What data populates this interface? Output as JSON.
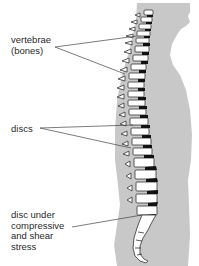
{
  "diagram": {
    "labels": {
      "vertebrae": "vertebrae\n(bones)",
      "discs": "discs",
      "disc_stress": "disc under\ncompressive\nand shear\nstress"
    },
    "colors": {
      "body_silhouette": "#c8c8c8",
      "bone": "#ffffff",
      "disc": "#111111",
      "outline": "#333333",
      "leader_line": "#444444",
      "label_text": "#2a2a2a"
    }
  }
}
